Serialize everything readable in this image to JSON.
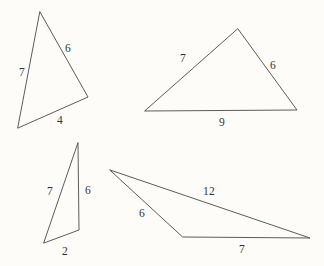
{
  "page": {
    "background_color": "#fdfcf8",
    "stroke_color": "#4a4a4a",
    "label_color": "#333333",
    "width": 324,
    "height": 266
  },
  "figures": [
    {
      "id": "triangle-top-left",
      "name": "scalene-triangle",
      "points": "40,12 88,97 18,128",
      "labels": [
        {
          "text": "7",
          "x": 22,
          "y": 72
        },
        {
          "text": "6",
          "x": 68,
          "y": 48
        },
        {
          "text": "4",
          "x": 60,
          "y": 120
        }
      ]
    },
    {
      "id": "triangle-top-right",
      "name": "wide-triangle",
      "points": "238,29 297,110 145,111",
      "labels": [
        {
          "text": "7",
          "x": 183,
          "y": 58
        },
        {
          "text": "6",
          "x": 273,
          "y": 65
        },
        {
          "text": "9",
          "x": 222,
          "y": 122
        }
      ]
    },
    {
      "id": "triangle-bottom-left",
      "name": "narrow-sliver-triangle",
      "points": "78,143 79,230 44,243",
      "labels": [
        {
          "text": "7",
          "x": 50,
          "y": 191
        },
        {
          "text": "6",
          "x": 88,
          "y": 190
        },
        {
          "text": "2",
          "x": 65,
          "y": 251
        }
      ]
    },
    {
      "id": "triangle-bottom-right",
      "name": "obtuse-flat-triangle",
      "points": "110,170 310,238 183,237",
      "labels": [
        {
          "text": "6",
          "x": 142,
          "y": 213
        },
        {
          "text": "12",
          "x": 209,
          "y": 191
        },
        {
          "text": "7",
          "x": 242,
          "y": 249
        }
      ]
    }
  ]
}
